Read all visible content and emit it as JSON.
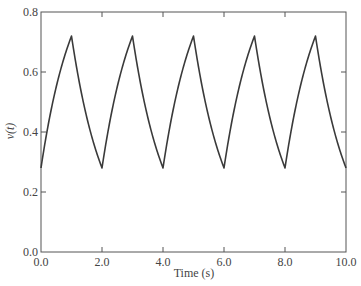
{
  "chart_data": {
    "type": "line",
    "title": "",
    "xlabel": "Time (s)",
    "ylabel": "v(t)",
    "xlim": [
      0,
      10
    ],
    "ylim": [
      0,
      0.8
    ],
    "grid": false,
    "legend": null,
    "x_ticks": [
      "0.0",
      "2.0",
      "4.0",
      "6.0",
      "8.0",
      "10.0"
    ],
    "x_tick_values": [
      0,
      2,
      4,
      6,
      8,
      10
    ],
    "y_ticks": [
      "0.0",
      "0.2",
      "0.4",
      "0.6",
      "0.8"
    ],
    "y_tick_values": [
      0,
      0.2,
      0.4,
      0.6,
      0.8
    ],
    "series": [
      {
        "name": "v(t)",
        "color": "#3a3a3a",
        "x": [
          0,
          0.25,
          0.5,
          0.75,
          1.0,
          1.25,
          1.5,
          1.75,
          2.0,
          2.25,
          2.5,
          2.75,
          3.0,
          3.25,
          3.5,
          3.75,
          4.0,
          4.25,
          4.5,
          4.75,
          5.0,
          5.25,
          5.5,
          5.75,
          6.0,
          6.25,
          6.5,
          6.75,
          7.0,
          7.25,
          7.5,
          7.75,
          8.0,
          8.25,
          8.5,
          8.75,
          9.0,
          9.25,
          9.5,
          9.75,
          10.0
        ],
        "values": [
          0.28,
          0.431,
          0.551,
          0.645,
          0.72,
          0.569,
          0.449,
          0.355,
          0.28,
          0.431,
          0.551,
          0.645,
          0.72,
          0.569,
          0.449,
          0.355,
          0.28,
          0.431,
          0.551,
          0.645,
          0.72,
          0.569,
          0.449,
          0.355,
          0.28,
          0.431,
          0.551,
          0.645,
          0.72,
          0.569,
          0.449,
          0.355,
          0.28,
          0.431,
          0.551,
          0.645,
          0.72,
          0.569,
          0.449,
          0.355,
          0.28
        ]
      }
    ],
    "annotations": {
      "peak_value": 0.72,
      "trough_value": 0.28,
      "period_s": 2.0
    }
  },
  "frame": {
    "color": "#555555"
  }
}
